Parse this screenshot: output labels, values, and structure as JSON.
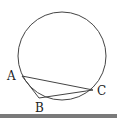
{
  "diagram": {
    "type": "circle-with-inscribed-triangle",
    "circle": {
      "cx": 62,
      "cy": 56,
      "r": 44,
      "stroke": "#444444"
    },
    "points": [
      {
        "name": "A",
        "x": 22,
        "y": 76,
        "label": "A",
        "label_x": 7,
        "label_y": 80
      },
      {
        "name": "B",
        "x": 39,
        "y": 98,
        "label": "B",
        "label_x": 35,
        "label_y": 112
      },
      {
        "name": "C",
        "x": 93,
        "y": 90,
        "label": "C",
        "label_x": 97,
        "label_y": 95
      }
    ],
    "segments": [
      {
        "from": "A",
        "to": "C"
      },
      {
        "from": "A",
        "to": "B"
      },
      {
        "from": "B",
        "to": "C"
      }
    ]
  },
  "colors": {
    "line": "#444444",
    "text": "#222222",
    "bottom_bar": "#7a7a7a"
  }
}
